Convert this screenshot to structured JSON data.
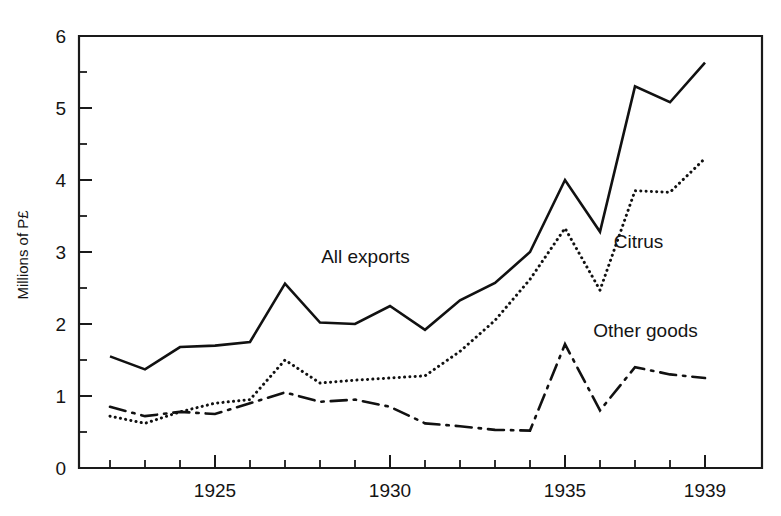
{
  "chart_data": {
    "type": "line",
    "title": "",
    "xlabel": "",
    "ylabel": "Millions of P£",
    "xlim": [
      1922,
      1939
    ],
    "ylim": [
      0,
      6
    ],
    "grid": false,
    "legend_position": "inline-annotations",
    "x": [
      1922,
      1923,
      1924,
      1925,
      1926,
      1927,
      1928,
      1929,
      1930,
      1931,
      1932,
      1933,
      1934,
      1935,
      1936,
      1937,
      1938,
      1939
    ],
    "x_tick_labels": [
      "1925",
      "1930",
      "1935",
      "1939"
    ],
    "x_tick_label_values": [
      1925,
      1930,
      1935,
      1939
    ],
    "y_tick_labels": [
      "0",
      "1",
      "2",
      "3",
      "4",
      "5",
      "6"
    ],
    "y_tick_label_values": [
      0,
      1,
      2,
      3,
      4,
      5,
      6
    ],
    "y_minor_ticks": [
      0.5,
      1.5,
      2.5,
      3.5,
      4.5,
      5.5
    ],
    "series": [
      {
        "name": "All exports",
        "style": "solid",
        "label": "All exports",
        "values": [
          1.55,
          1.37,
          1.68,
          1.7,
          1.75,
          2.56,
          2.02,
          2.0,
          2.25,
          1.92,
          2.33,
          2.57,
          3.0,
          4.0,
          3.28,
          5.3,
          5.08,
          5.63
        ]
      },
      {
        "name": "Citrus",
        "style": "dotted",
        "label": "Citrus",
        "values": [
          0.72,
          0.62,
          0.78,
          0.9,
          0.95,
          1.5,
          1.18,
          1.22,
          1.25,
          1.28,
          1.62,
          2.05,
          2.62,
          3.33,
          2.47,
          3.85,
          3.83,
          4.3
        ]
      },
      {
        "name": "Other goods",
        "style": "dashdot",
        "label": "Other goods",
        "values": [
          0.85,
          0.72,
          0.78,
          0.75,
          0.9,
          1.05,
          0.92,
          0.95,
          0.85,
          0.62,
          0.58,
          0.53,
          0.52,
          1.72,
          0.8,
          1.4,
          1.3,
          1.25
        ]
      }
    ],
    "annotations": [
      {
        "text": "All exports",
        "x": 1929.3,
        "y": 2.85,
        "anchor": "middle"
      },
      {
        "text": "Citrus",
        "x": 1937.1,
        "y": 3.05,
        "anchor": "middle"
      },
      {
        "text": "Other goods",
        "x": 1937.3,
        "y": 1.82,
        "anchor": "middle"
      }
    ]
  },
  "axis": {
    "y_title": "Millions of P£"
  }
}
